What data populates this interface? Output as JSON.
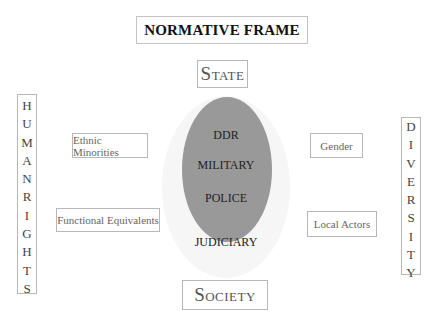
{
  "title": "NORMATIVE FRAME",
  "top_node": "State",
  "bottom_node": "Society",
  "left_vertical": [
    "H",
    "U",
    "M",
    "A",
    "N",
    "",
    "R",
    "I",
    "G",
    "H",
    "T",
    "S"
  ],
  "left_vertical_label": "HUMAN RIGHTS",
  "right_vertical": [
    "D",
    "I",
    "V",
    "E",
    "R",
    "S",
    "I",
    "T",
    "Y"
  ],
  "right_vertical_label": "DIVERSITY",
  "left_boxes": [
    "Ethnic Minorities",
    "Functional Equivalents"
  ],
  "right_boxes": [
    "Gender",
    "Local Actors"
  ],
  "core": {
    "inner": [
      "DDR",
      "MILITARY",
      "POLICE"
    ],
    "outer": "JUDICIARY"
  },
  "colors": {
    "inner_ellipse": "#999999",
    "outer_ellipse": "#f6f6f6",
    "box_border": "#b8b8b8"
  }
}
